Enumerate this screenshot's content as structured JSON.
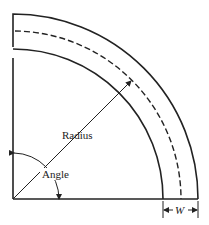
{
  "diagram": {
    "type": "curved-bend-geometry",
    "labels": {
      "radius": "Radius",
      "angle": "Angle",
      "width": "W"
    },
    "colors": {
      "stroke": "#222222",
      "background": "#ffffff"
    }
  }
}
